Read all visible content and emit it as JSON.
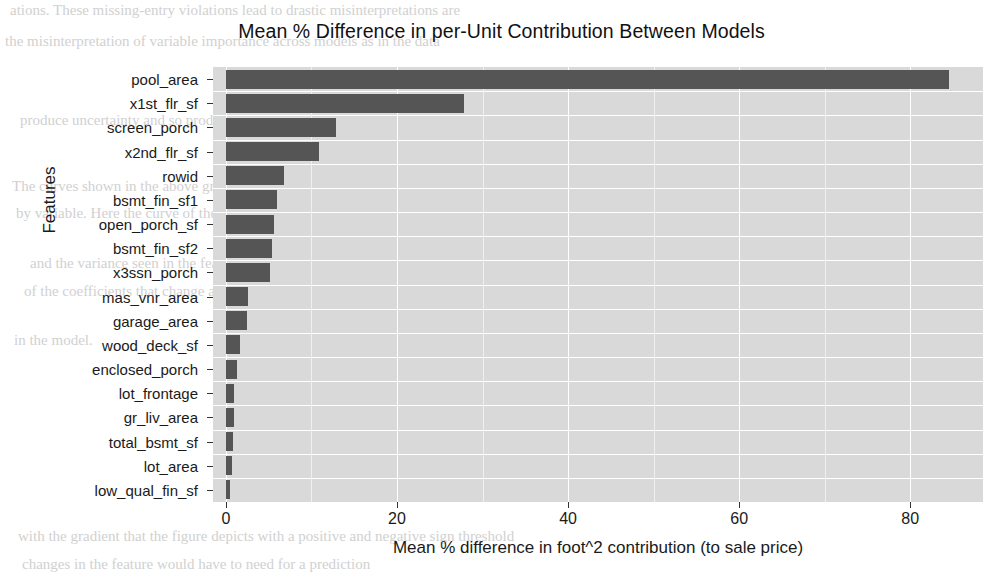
{
  "chart_data": {
    "type": "bar",
    "orientation": "horizontal",
    "title": "Mean % Difference in per-Unit Contribution Between Models",
    "xlabel": "Mean % difference in foot^2 contribution (to sale price)",
    "ylabel": "Features",
    "categories": [
      "pool_area",
      "x1st_flr_sf",
      "screen_porch",
      "x2nd_flr_sf",
      "rowid",
      "bsmt_fin_sf1",
      "open_porch_sf",
      "bsmt_fin_sf2",
      "x3ssn_porch",
      "mas_vnr_area",
      "garage_area",
      "wood_deck_sf",
      "enclosed_porch",
      "lot_frontage",
      "gr_liv_area",
      "total_bsmt_sf",
      "lot_area",
      "low_qual_fin_sf"
    ],
    "values": [
      84.5,
      27.8,
      12.9,
      10.9,
      6.8,
      6.0,
      5.6,
      5.4,
      5.2,
      2.6,
      2.5,
      1.6,
      1.3,
      1.0,
      0.9,
      0.8,
      0.7,
      0.5
    ],
    "xlim": [
      -1.5,
      88.5
    ],
    "xticks": [
      0,
      20,
      40,
      60,
      80
    ],
    "xtick_labels": [
      "0",
      "20",
      "40",
      "60",
      "80"
    ],
    "grid": true,
    "legend": null,
    "bar_color": "#555555",
    "panel_background": "#d9d9d9",
    "gridline_color": "#ffffff"
  },
  "background_text": {
    "lines": [
      "ations. These missing-entry violations lead to drastic misinterpretations are",
      "the misinterpretation of variable importance across models as in the data",
      "produce uncertainty and so produces",
      "The curves shown in the above graph depict the uncertainty of feature contributions",
      "by variable. Here the curve of the model that produced the most variance",
      "and the variance seen in the feature space a model may estimate",
      "of the coefficients that change across models with the structure of the",
      "in the model.",
      "with the gradient that the figure depicts with a positive and negative sign threshold",
      "changes in the feature would have to need for a prediction"
    ]
  }
}
